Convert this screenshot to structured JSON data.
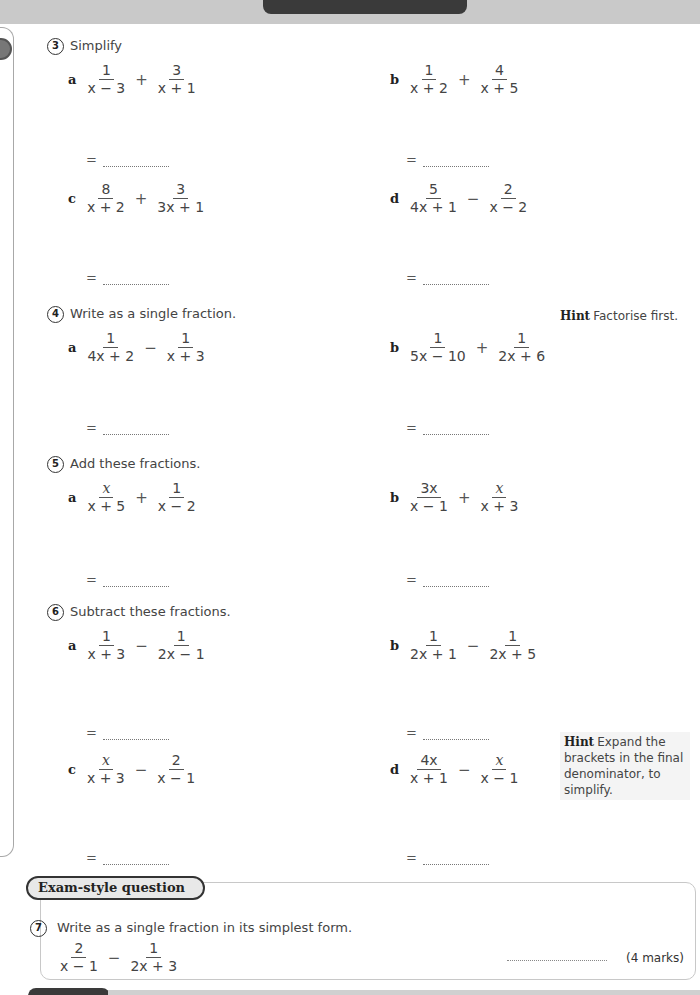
{
  "questions": [
    {
      "number": "3",
      "instruction": "Simplify",
      "parts": [
        {
          "label": "a",
          "terms": [
            {
              "num": "1",
              "den": "x − 3"
            },
            {
              "num": "3",
              "den": "x + 1"
            }
          ],
          "op": "+"
        },
        {
          "label": "b",
          "terms": [
            {
              "num": "1",
              "den": "x + 2"
            },
            {
              "num": "4",
              "den": "x + 5"
            }
          ],
          "op": "+"
        },
        {
          "label": "c",
          "terms": [
            {
              "num": "8",
              "den": "x + 2"
            },
            {
              "num": "3",
              "den": "3x + 1"
            }
          ],
          "op": "+"
        },
        {
          "label": "d",
          "terms": [
            {
              "num": "5",
              "den": "4x + 1"
            },
            {
              "num": "2",
              "den": "x − 2"
            }
          ],
          "op": "−"
        }
      ]
    },
    {
      "number": "4",
      "instruction": "Write as a single fraction.",
      "hint": {
        "label": "Hint",
        "text": "Factorise first."
      },
      "parts": [
        {
          "label": "a",
          "terms": [
            {
              "num": "1",
              "den": "4x + 2"
            },
            {
              "num": "1",
              "den": "x + 3"
            }
          ],
          "op": "−"
        },
        {
          "label": "b",
          "terms": [
            {
              "num": "1",
              "den": "5x − 10"
            },
            {
              "num": "1",
              "den": "2x + 6"
            }
          ],
          "op": "+"
        }
      ]
    },
    {
      "number": "5",
      "instruction": "Add these fractions.",
      "parts": [
        {
          "label": "a",
          "terms": [
            {
              "num": "x",
              "den": "x + 5"
            },
            {
              "num": "1",
              "den": "x − 2"
            }
          ],
          "op": "+"
        },
        {
          "label": "b",
          "terms": [
            {
              "num": "3x",
              "den": "x − 1"
            },
            {
              "num": "x",
              "den": "x + 3"
            }
          ],
          "op": "+"
        }
      ]
    },
    {
      "number": "6",
      "instruction": "Subtract these fractions.",
      "hint": {
        "label": "Hint",
        "text": "Expand the brackets in the final denominator, to simplify."
      },
      "parts": [
        {
          "label": "a",
          "terms": [
            {
              "num": "1",
              "den": "x + 3"
            },
            {
              "num": "1",
              "den": "2x − 1"
            }
          ],
          "op": "−"
        },
        {
          "label": "b",
          "terms": [
            {
              "num": "1",
              "den": "2x + 1"
            },
            {
              "num": "1",
              "den": "2x + 5"
            }
          ],
          "op": "−"
        },
        {
          "label": "c",
          "terms": [
            {
              "num": "x",
              "den": "x + 3"
            },
            {
              "num": "2",
              "den": "x − 1"
            }
          ],
          "op": "−"
        },
        {
          "label": "d",
          "terms": [
            {
              "num": "4x",
              "den": "x + 1"
            },
            {
              "num": "x",
              "den": "x − 1"
            }
          ],
          "op": "−"
        }
      ]
    }
  ],
  "answer_prefix": "=",
  "exam": {
    "title": "Exam-style question",
    "number": "7",
    "instruction": "Write as a single fraction in its simplest form.",
    "terms": [
      {
        "num": "2",
        "den": "x − 1"
      },
      {
        "num": "1",
        "den": "2x + 3"
      }
    ],
    "op": "−",
    "marks": "(4 marks)"
  }
}
